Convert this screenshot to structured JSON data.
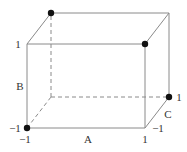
{
  "diagram": {
    "type": "cube",
    "axes": {
      "A": {
        "label": "A",
        "low": "−1",
        "high": "1"
      },
      "B": {
        "label": "B",
        "low": "−1",
        "high": "1"
      },
      "C": {
        "label": "C",
        "low": "−1",
        "high": "1"
      }
    },
    "highlighted_points": [
      {
        "A": -1,
        "B": -1,
        "C": -1
      },
      {
        "A": 1,
        "B": 1,
        "C": -1
      },
      {
        "A": -1,
        "B": 1,
        "C": 1
      },
      {
        "A": 1,
        "B": -1,
        "C": 1
      }
    ],
    "colors": {
      "edge": "#8a8a8a",
      "hidden_edge": "#8a8a8a",
      "point": "#111111",
      "text": "#333333"
    },
    "labels": {
      "a_axis": "A",
      "b_axis": "B",
      "c_axis": "C",
      "a_low": "−1",
      "a_high": "1",
      "b_low": "−1",
      "b_high": "1",
      "c_low": "−1",
      "c_high": "1"
    }
  }
}
